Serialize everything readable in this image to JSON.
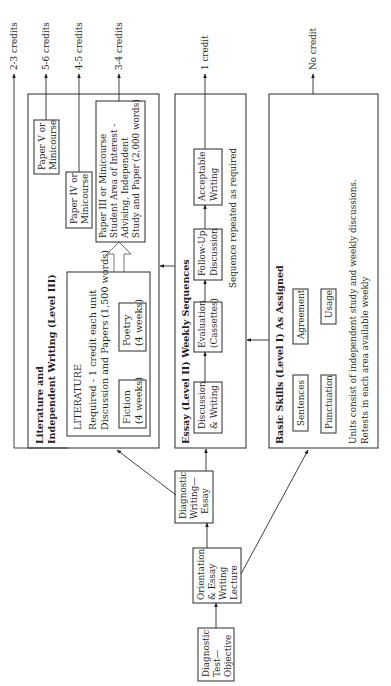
{
  "diagram": {
    "orientation": "rotated-90-ccw",
    "credit_outputs": [
      {
        "label": "2-3 credits"
      },
      {
        "label": "5-6 credits"
      },
      {
        "label": "4-5 credits"
      },
      {
        "label": "3-4 credits"
      },
      {
        "label": "1 credit"
      },
      {
        "label": "No credit"
      }
    ],
    "entry_nodes": {
      "diagnostic_test": {
        "lines": [
          "Diagnostic",
          "Test—",
          "Objective"
        ]
      },
      "orientation": {
        "lines": [
          "Orientation",
          "& Essay",
          "Writing",
          "Lecture"
        ]
      },
      "diagnostic_writing": {
        "lines": [
          "Diagnostic",
          "Writing—",
          "Essay"
        ]
      }
    },
    "level3": {
      "title_lines": [
        "Literature and",
        "Independent Writing (Level III)"
      ],
      "literature": {
        "heading": "LITERATURE",
        "desc_lines": [
          "Required - 1 credit each unit",
          "Discussion and Papers (1,500 words)"
        ],
        "units": [
          {
            "lines": [
              "Fiction",
              "(4 weeks)"
            ]
          },
          {
            "lines": [
              "Poetry",
              "(4 weeks)"
            ]
          }
        ]
      },
      "paper3": {
        "lines": [
          "Paper III or Minicourse",
          "Student Area of Interest -",
          "Advising, Independent",
          "Study and Paper (2,000 words)"
        ]
      },
      "paper4": {
        "lines": [
          "Paper IV or",
          "Minicourse"
        ]
      },
      "paper5": {
        "lines": [
          "Paper V or",
          "Minicourse"
        ]
      }
    },
    "level2": {
      "title": "Essay (Level II) Weekly Sequences",
      "steps": [
        {
          "lines": [
            "Discussion",
            "& Writing"
          ]
        },
        {
          "lines": [
            "Evaluation",
            "(Cassettes)"
          ]
        },
        {
          "lines": [
            "Follow-Up",
            "Discussion"
          ]
        },
        {
          "lines": [
            "Acceptable",
            "Writing"
          ]
        }
      ],
      "note": "Sequence repeated as required"
    },
    "level1": {
      "title": "Basic Skills (Level I) As Assigned",
      "skills": [
        {
          "label": "Sentences"
        },
        {
          "label": "Agreement"
        },
        {
          "label": "Punctuation"
        },
        {
          "label": "Usage"
        }
      ],
      "note_lines": [
        "Units consist of independent study and weekly discussions.",
        "Retests in each area available weekly"
      ]
    }
  }
}
